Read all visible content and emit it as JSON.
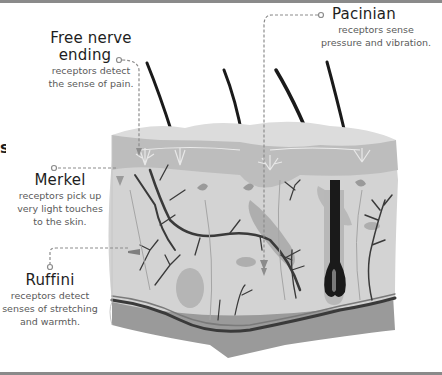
{
  "diagram": {
    "edge_fragment": "s",
    "receptors": [
      {
        "id": "free-nerve-ending",
        "title": "Free nerve ending",
        "title_line1": "Free nerve",
        "title_line2": "ending",
        "desc_line1": "receptors detect",
        "desc_line2": "the sense of pain."
      },
      {
        "id": "pacinian",
        "title": "Pacinian",
        "desc_line1": "receptors sense",
        "desc_line2": "pressure and vibration."
      },
      {
        "id": "merkel",
        "title": "Merkel",
        "desc_line1": "receptors pick up",
        "desc_line2": "very light touches",
        "desc_line3": "to the skin."
      },
      {
        "id": "ruffini",
        "title": "Ruffini",
        "desc_line1": "receptors detect",
        "desc_line2": "senses of stretching",
        "desc_line3": "and warmth."
      }
    ],
    "colors": {
      "epidermis_top": "#d8d8d8",
      "epidermis": "#bdbdbd",
      "dermis": "#d3d3d3",
      "fat_layer": "#9a9a9a",
      "nerve": "#3a3a3a",
      "hair": "#1a1a1a",
      "connector": "#8c8c8c"
    }
  }
}
